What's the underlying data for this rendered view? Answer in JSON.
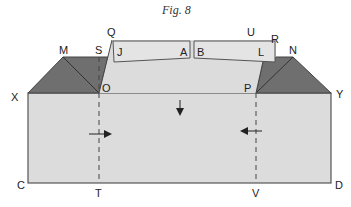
{
  "title": "Fig. 8",
  "colors": {
    "light_fill": "#dcdcdc",
    "bar_fill": "#e4e4e4",
    "dark_fill": "#6f6f6f",
    "stroke": "#444444"
  },
  "labels": {
    "Q": "Q",
    "U": "U",
    "R": "R",
    "M": "M",
    "S": "S",
    "N": "N",
    "J": "J",
    "A": "A",
    "B": "B",
    "L": "L",
    "X": "X",
    "O": "O",
    "P": "P",
    "Y": "Y",
    "C": "C",
    "T": "T",
    "V": "V",
    "D": "D"
  }
}
